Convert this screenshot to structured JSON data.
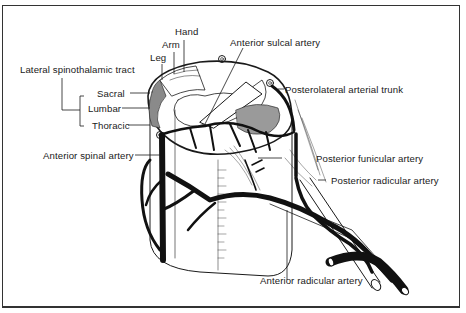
{
  "figure": {
    "labels": {
      "hand": "Hand",
      "arm": "Arm",
      "leg": "Leg",
      "lateral_spinothalamic_tract": "Lateral spinothalamic tract",
      "sacral": "Sacral",
      "lumbar": "Lumbar",
      "thoracic": "Thoracic",
      "anterior_sulcal_artery": "Anterior sulcal artery",
      "posterolateral_arterial_trunk": "Posterolateral arterial trunk",
      "anterior_spinal_artery": "Anterior spinal artery",
      "posterior_funicular_artery": "Posterior funicular artery",
      "posterior_radicular_artery": "Posterior radicular artery",
      "anterior_radicular_artery": "Anterior radicular artery"
    },
    "colors": {
      "ink": "#1a1a1a",
      "paper": "#ffffff",
      "stipple": "#8a8a8a",
      "frame": "#333333"
    }
  }
}
